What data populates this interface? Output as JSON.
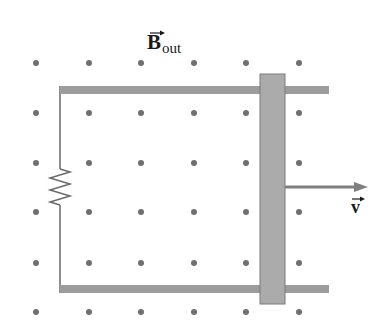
{
  "figure": {
    "field_label": {
      "symbol": "B",
      "subscript": "out",
      "vector_arrow": true
    },
    "velocity_label": {
      "symbol": "v",
      "vector_arrow": true
    },
    "colors": {
      "dots": "#6f6f6f",
      "rails": "#9c9c9c",
      "bar_fill": "#ababab",
      "bar_border": "#7a7a7a",
      "wire": "#6a6a6a",
      "arrow": "#808080"
    },
    "dot_grid": {
      "columns_x": [
        36,
        89,
        141,
        194,
        246,
        299
      ],
      "rows_y": [
        63,
        113,
        163,
        212,
        263,
        312
      ],
      "radius": 3
    },
    "rails": {
      "left_x": 60,
      "right_x": 329,
      "top_y": 86,
      "bottom_y": 285,
      "thickness": 8
    },
    "bar": {
      "x": 260,
      "y": 74,
      "width": 25,
      "height": 230
    },
    "resistor": {
      "x": 60,
      "y_start": 169,
      "y_end": 205,
      "zigzags": 6,
      "amplitude": 10
    },
    "velocity_arrow": {
      "x1": 285,
      "x2": 368,
      "y": 187
    }
  }
}
